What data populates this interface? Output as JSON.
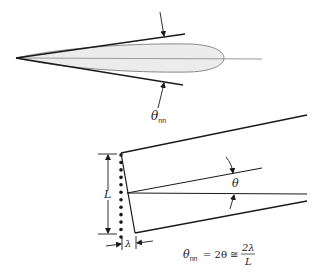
{
  "diagram": {
    "top": {
      "beamwidth_label": {
        "symbol": "θ",
        "subscript": "nn"
      }
    },
    "bottom": {
      "aperture_label": "L",
      "wavelength_label": "λ",
      "half_angle_label": "θ",
      "element_count": 12,
      "equation": {
        "lhs_symbol": "θ",
        "lhs_subscript": "nn",
        "middle": "= 2θ ≅",
        "numerator": "2λ",
        "denominator": "L"
      }
    },
    "colors": {
      "line": "#1a1a1a",
      "lobe_fill": "#ececec",
      "lobe_stroke": "#8a8a8a",
      "axis": "#9a9a9a"
    }
  }
}
